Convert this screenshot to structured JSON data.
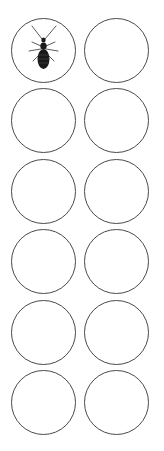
{
  "grid": {
    "rows": 6,
    "columns": 2,
    "slots": [
      {
        "index": 0,
        "content": "insect-icon",
        "filled": true
      },
      {
        "index": 1,
        "content": "",
        "filled": false
      },
      {
        "index": 2,
        "content": "",
        "filled": false
      },
      {
        "index": 3,
        "content": "",
        "filled": false
      },
      {
        "index": 4,
        "content": "",
        "filled": false
      },
      {
        "index": 5,
        "content": "",
        "filled": false
      },
      {
        "index": 6,
        "content": "",
        "filled": false
      },
      {
        "index": 7,
        "content": "",
        "filled": false
      },
      {
        "index": 8,
        "content": "",
        "filled": false
      },
      {
        "index": 9,
        "content": "",
        "filled": false
      },
      {
        "index": 10,
        "content": "",
        "filled": false
      },
      {
        "index": 11,
        "content": "",
        "filled": false
      }
    ]
  },
  "colors": {
    "ring": "#4a4a4a",
    "insect": "#1a1a1a",
    "background": "#ffffff"
  }
}
